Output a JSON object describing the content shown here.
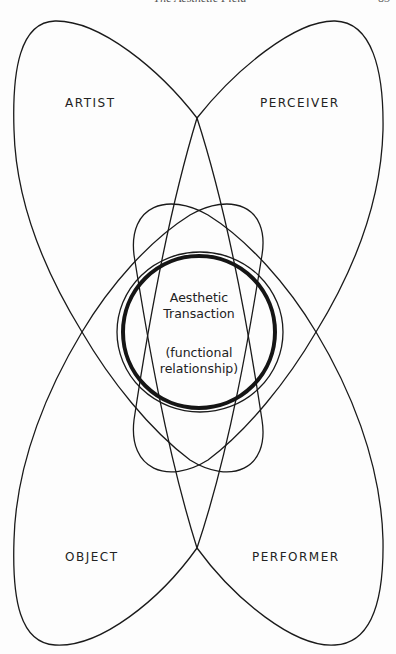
{
  "header": {
    "running_title": "The Aesthetic Field",
    "page_number": "83"
  },
  "diagram": {
    "lobes": [
      {
        "id": "artist",
        "label": "ARTIST"
      },
      {
        "id": "perceiver",
        "label": "PERCEIVER"
      },
      {
        "id": "object",
        "label": "OBJECT"
      },
      {
        "id": "performer",
        "label": "PERFORMER"
      }
    ],
    "center": {
      "title_line1": "Aesthetic",
      "title_line2": "Transaction",
      "subtitle_line1": "(functional",
      "subtitle_line2": "relationship)"
    },
    "colors": {
      "stroke": "#1a1a1a",
      "background": "#fdfdfd"
    }
  }
}
